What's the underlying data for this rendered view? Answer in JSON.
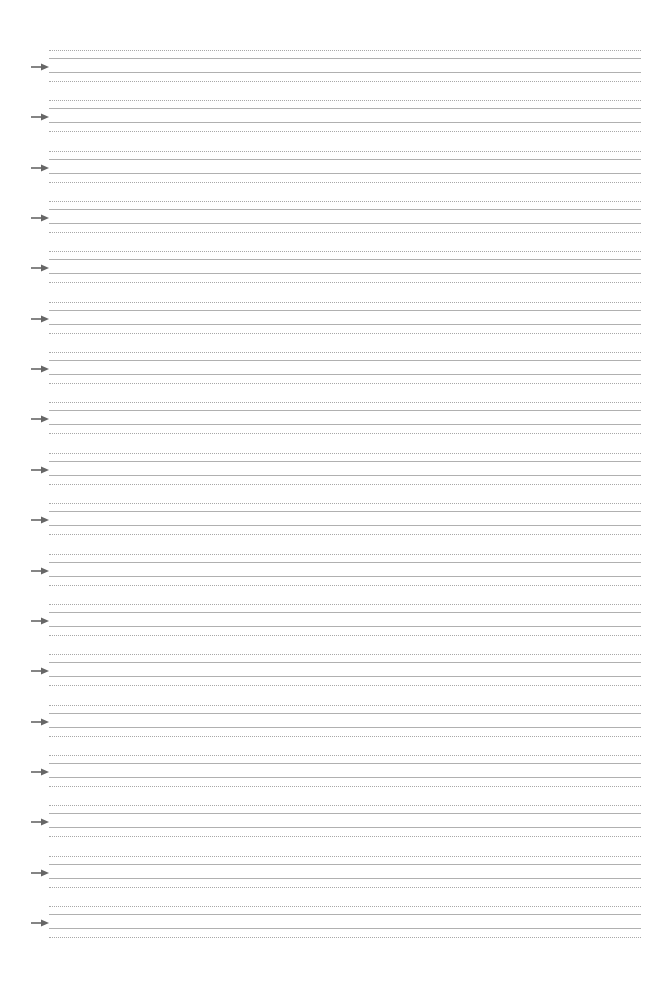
{
  "document": {
    "type": "handwriting practice sheet",
    "group_count": 18,
    "first_group_top_px": 50,
    "group_pitch_px": 50.35,
    "icon": "arrow-right-icon",
    "colors": {
      "background": "#ffffff",
      "guide_line": "#b0b0b0",
      "dotted_line": "#a8a8a8",
      "arrow": "#666666"
    }
  }
}
